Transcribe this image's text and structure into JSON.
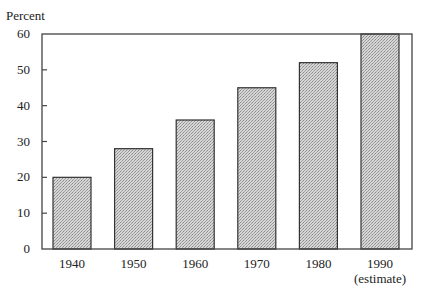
{
  "chart_data": {
    "type": "bar",
    "title": "",
    "xlabel": "",
    "ylabel": "Percent",
    "ylim": [
      0,
      60
    ],
    "yticks": [
      0,
      10,
      20,
      30,
      40,
      50,
      60
    ],
    "categories": [
      "1940",
      "1950",
      "1960",
      "1970",
      "1980",
      "1990"
    ],
    "category_sublabels": [
      "",
      "",
      "",
      "",
      "",
      "(estimate)"
    ],
    "values": [
      20,
      28,
      36,
      45,
      52,
      60
    ],
    "grid": false,
    "legend": null,
    "bar_fill": "#c8c8c8",
    "bar_pattern": "stipple",
    "bar_stroke": "#333333",
    "frame": true
  }
}
